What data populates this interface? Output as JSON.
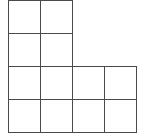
{
  "diagram": {
    "type": "grid-shape",
    "cell_size_px": 32,
    "line_color": "#4a4a4a",
    "origin": {
      "x": 8,
      "y": 0
    },
    "cells": [
      {
        "row": 0,
        "col": 0
      },
      {
        "row": 0,
        "col": 1
      },
      {
        "row": 1,
        "col": 0
      },
      {
        "row": 1,
        "col": 1
      },
      {
        "row": 2,
        "col": 0
      },
      {
        "row": 2,
        "col": 1
      },
      {
        "row": 2,
        "col": 2
      },
      {
        "row": 2,
        "col": 3
      },
      {
        "row": 3,
        "col": 0
      },
      {
        "row": 3,
        "col": 1
      },
      {
        "row": 3,
        "col": 2
      },
      {
        "row": 3,
        "col": 3
      }
    ],
    "cell_count": 12
  }
}
